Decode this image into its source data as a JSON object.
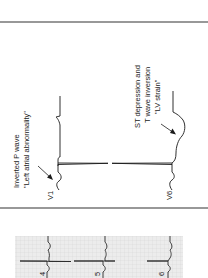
{
  "diagram": {
    "orientation": "rotated-90-ccw",
    "panel": {
      "leads": [
        {
          "name": "V1",
          "annotation_line1": "Inverted P wave",
          "annotation_line2": "\"Left atrial abnormality\""
        },
        {
          "name": "V6",
          "annotation_line1": "ST depression and",
          "annotation_line2": "T wave inversion",
          "annotation_line3": "\"LV strain\""
        }
      ]
    },
    "strip": {
      "leads": [
        "4",
        "5",
        "6"
      ]
    },
    "colors": {
      "trace": "#1a1a1a",
      "grid_bg": "#ececec",
      "grid_line": "#c9c9c9",
      "border": "#333333"
    }
  }
}
